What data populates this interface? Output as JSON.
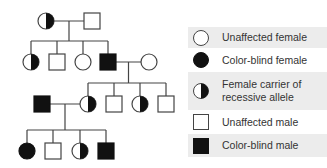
{
  "colors": {
    "line": "#444444",
    "fill": "#111111",
    "background": "#ffffff",
    "legend_shade": "#ececec",
    "text": "#333333"
  },
  "pedigree": {
    "generations": [
      {
        "label": "I",
        "individuals": [
          {
            "id": "I-1",
            "sex": "female",
            "status": "carrier"
          },
          {
            "id": "I-2",
            "sex": "male",
            "status": "unaffected"
          }
        ]
      },
      {
        "label": "II",
        "individuals": [
          {
            "id": "II-1",
            "sex": "female",
            "status": "carrier"
          },
          {
            "id": "II-2",
            "sex": "male",
            "status": "unaffected"
          },
          {
            "id": "II-3",
            "sex": "female",
            "status": "unaffected"
          },
          {
            "id": "II-4",
            "sex": "male",
            "status": "affected"
          },
          {
            "id": "II-5",
            "sex": "female",
            "status": "unaffected",
            "spouse_of": "II-4"
          }
        ]
      },
      {
        "label": "III",
        "individuals": [
          {
            "id": "III-1",
            "sex": "male",
            "status": "affected",
            "spouse_of": "III-2"
          },
          {
            "id": "III-2",
            "sex": "female",
            "status": "carrier"
          },
          {
            "id": "III-3",
            "sex": "male",
            "status": "unaffected"
          },
          {
            "id": "III-4",
            "sex": "female",
            "status": "carrier"
          },
          {
            "id": "III-5",
            "sex": "male",
            "status": "unaffected"
          }
        ]
      },
      {
        "label": "IV",
        "individuals": [
          {
            "id": "IV-1",
            "sex": "female",
            "status": "affected"
          },
          {
            "id": "IV-2",
            "sex": "male",
            "status": "unaffected"
          },
          {
            "id": "IV-3",
            "sex": "female",
            "status": "carrier"
          },
          {
            "id": "IV-4",
            "sex": "male",
            "status": "affected"
          }
        ]
      }
    ],
    "matings": [
      {
        "parents": [
          "I-1",
          "I-2"
        ],
        "children": [
          "II-1",
          "II-2",
          "II-3",
          "II-4"
        ]
      },
      {
        "parents": [
          "II-4",
          "II-5"
        ],
        "children": [
          "III-2",
          "III-3",
          "III-4",
          "III-5"
        ]
      },
      {
        "parents": [
          "III-1",
          "III-2"
        ],
        "children": [
          "IV-1",
          "IV-2",
          "IV-3",
          "IV-4"
        ]
      }
    ]
  },
  "legend": {
    "items": [
      {
        "symbol": "unaffected-female",
        "label": "Unaffected female"
      },
      {
        "symbol": "affected-female",
        "label": "Color-blind female"
      },
      {
        "symbol": "carrier-female",
        "label": "Female carrier of recessive allele"
      },
      {
        "symbol": "unaffected-male",
        "label": "Unaffected male"
      },
      {
        "symbol": "affected-male",
        "label": "Color-blind male"
      }
    ]
  }
}
